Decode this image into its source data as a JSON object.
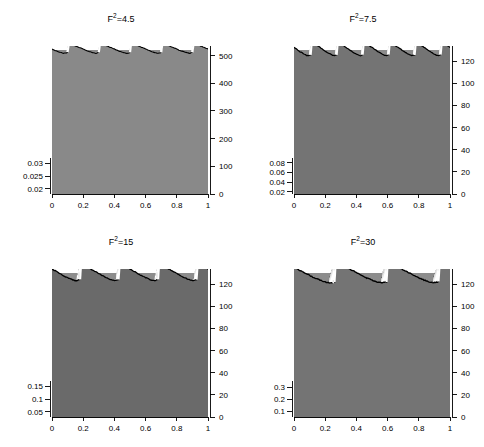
{
  "figure": {
    "title": "",
    "background": "#ffffff",
    "surface_base_color": "#8c8c8c",
    "line_color": "#000000",
    "highlight_color": "#ffffff",
    "layout": "2x2 grid of 3D waterfall surface plots"
  },
  "chart_data": [
    {
      "type": "line",
      "title": "F²=4.5",
      "title_base": "F",
      "title_exp": "2",
      "title_value": "=4.5",
      "xlabel": "",
      "ylabel": "",
      "xlim": [
        0,
        1
      ],
      "xticks": [
        0,
        0.2,
        0.4,
        0.6,
        0.8,
        1
      ],
      "xticklabels": [
        "0",
        "0.2",
        "0.4",
        "0.6",
        "0.8",
        "1"
      ],
      "right_axis_label": "",
      "right_ticks": [
        0,
        100,
        200,
        300,
        400,
        500
      ],
      "right_ticklabels": [
        "0",
        "100",
        "200",
        "300",
        "400",
        "500"
      ],
      "right_lim": [
        0,
        520
      ],
      "left_ticks": [
        0.02,
        0.025,
        0.03
      ],
      "left_ticklabels": [
        "0.02",
        "0.025",
        "0.03"
      ],
      "left_lim": [
        0.018,
        0.032
      ],
      "grid": false,
      "legend": "none",
      "n_traces": 150,
      "wave_count": 5,
      "steepening": 0.62,
      "amplitude": 0.55,
      "description": "Roll-wave surface evolution at Froude squared 4.5 over time 0 to 500"
    },
    {
      "type": "line",
      "title": "F²=7.5",
      "title_base": "F",
      "title_exp": "2",
      "title_value": "=7.5",
      "xlabel": "",
      "ylabel": "",
      "xlim": [
        0,
        1
      ],
      "xticks": [
        0,
        0.2,
        0.4,
        0.6,
        0.8,
        1
      ],
      "xticklabels": [
        "0",
        "0.2",
        "0.4",
        "0.6",
        "0.8",
        "1"
      ],
      "right_axis_label": "",
      "right_ticks": [
        0,
        20,
        40,
        60,
        80,
        100,
        120
      ],
      "right_ticklabels": [
        "0",
        "20",
        "40",
        "60",
        "80",
        "100",
        "120"
      ],
      "right_lim": [
        0,
        130
      ],
      "left_ticks": [
        0.02,
        0.04,
        0.06,
        0.08
      ],
      "left_ticklabels": [
        "0.02",
        "0.04",
        "0.06",
        "0.08"
      ],
      "left_lim": [
        0.015,
        0.09
      ],
      "grid": false,
      "legend": "none",
      "n_traces": 150,
      "wave_count": 6,
      "steepening": 0.78,
      "amplitude": 0.72,
      "description": "Roll-wave surface evolution at Froude squared 7.5 over time 0 to 125"
    },
    {
      "type": "line",
      "title": "F²=15",
      "title_base": "F",
      "title_exp": "2",
      "title_value": "=15",
      "xlabel": "",
      "ylabel": "",
      "xlim": [
        0,
        1
      ],
      "xticks": [
        0,
        0.2,
        0.4,
        0.6,
        0.8,
        1
      ],
      "xticklabels": [
        "0",
        "0.2",
        "0.4",
        "0.6",
        "0.8",
        "1"
      ],
      "right_axis_label": "",
      "right_ticks": [
        0,
        20,
        40,
        60,
        80,
        100,
        120
      ],
      "right_ticklabels": [
        "0",
        "20",
        "40",
        "60",
        "80",
        "100",
        "120"
      ],
      "right_lim": [
        0,
        130
      ],
      "left_ticks": [
        0.05,
        0.1,
        0.15
      ],
      "left_ticklabels": [
        "0.05",
        "0.1",
        "0.15"
      ],
      "left_lim": [
        0.03,
        0.17
      ],
      "grid": false,
      "legend": "none",
      "n_traces": 150,
      "wave_count": 4,
      "steepening": 0.85,
      "amplitude": 0.85,
      "description": "Roll-wave surface evolution at Froude squared 15 over time 0 to 125"
    },
    {
      "type": "line",
      "title": "F²=30",
      "title_base": "F",
      "title_exp": "2",
      "title_value": "=30",
      "xlabel": "",
      "ylabel": "",
      "xlim": [
        0,
        1
      ],
      "xticks": [
        0,
        0.2,
        0.4,
        0.6,
        0.8,
        1
      ],
      "xticklabels": [
        "0",
        "0.2",
        "0.4",
        "0.6",
        "0.8",
        "1"
      ],
      "right_axis_label": "",
      "right_ticks": [
        0,
        20,
        40,
        60,
        80,
        100,
        120
      ],
      "right_ticklabels": [
        "0",
        "20",
        "40",
        "60",
        "80",
        "100",
        "120"
      ],
      "right_lim": [
        0,
        130
      ],
      "left_ticks": [
        0.1,
        0.2,
        0.3
      ],
      "left_ticklabels": [
        "0.1",
        "0.2",
        "0.3"
      ],
      "left_lim": [
        0.05,
        0.35
      ],
      "grid": false,
      "legend": "none",
      "n_traces": 150,
      "wave_count": 3,
      "steepening": 0.92,
      "amplitude": 1.0,
      "description": "Roll-wave surface evolution at Froude squared 30 over time 0 to 125"
    }
  ]
}
